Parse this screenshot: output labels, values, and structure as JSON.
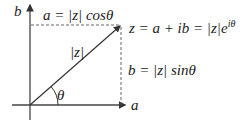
{
  "diagram": {
    "type": "complex-plane-polar-form",
    "axes": {
      "x_label": "a",
      "y_label": "b"
    },
    "point": {
      "label": "z = a + ib = |z|e^{iθ}",
      "text_main": "z = a + ib = |z|e",
      "text_sup": "iθ"
    },
    "horizontal_projection_label": "a = |z| cosθ",
    "vertical_projection_label": "b = |z| sinθ",
    "vector_label": "|z|",
    "angle_label": "θ",
    "colors": {
      "ink": "#333333",
      "dash": "#555555",
      "background": "#ffffff"
    }
  }
}
